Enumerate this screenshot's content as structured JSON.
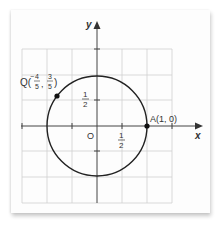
{
  "diagram": {
    "axes": {
      "x_label": "x",
      "y_label": "y",
      "origin_label": "O"
    },
    "ticks": {
      "x_half": {
        "num": "1",
        "den": "2"
      },
      "y_half": {
        "num": "1",
        "den": "2"
      }
    },
    "circle": {
      "center": [
        0,
        0
      ],
      "radius": 1,
      "color": "#222222"
    },
    "points": [
      {
        "name": "Q",
        "num_x": "4",
        "den_x": "5",
        "num_y": "3",
        "den_y": "5",
        "x": -0.8,
        "y": 0.6,
        "label_prefix": "Q(",
        "sign_x": "-"
      },
      {
        "name": "A",
        "label": "A(1, 0)",
        "x": 1,
        "y": 0
      }
    ],
    "grid": {
      "step": 0.5,
      "x_range": [
        -1.5,
        1.5
      ],
      "y_range": [
        -1.5,
        1.5
      ],
      "color": "#cfcfcf"
    }
  }
}
